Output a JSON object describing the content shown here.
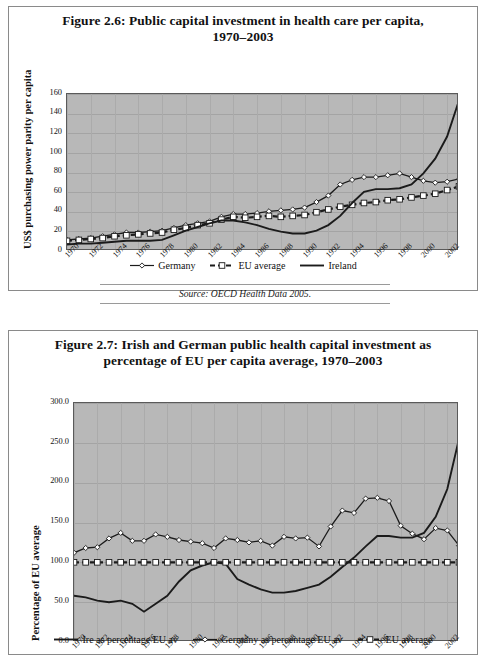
{
  "figures": [
    {
      "id": "fig-2-6",
      "title_line1": "Figure 2.6: Public capital investment in health care per capita,",
      "title_line2": "1970–2003",
      "source": "Source: OECD Health Data 2005.",
      "chart_data": {
        "type": "line",
        "title": "Figure 2.6: Public capital investment in health care per capita, 1970–2003",
        "xlabel": "",
        "ylabel": "US$ purchasing power parity per capita",
        "ylim": [
          0,
          170
        ],
        "yticks": [
          "0",
          "20",
          "40",
          "60",
          "80",
          "100",
          "120",
          "140",
          "160"
        ],
        "grid": true,
        "legend_position": "bottom",
        "x": [
          1970,
          1971,
          1972,
          1973,
          1974,
          1975,
          1976,
          1977,
          1978,
          1979,
          1980,
          1981,
          1982,
          1983,
          1984,
          1985,
          1986,
          1987,
          1988,
          1989,
          1990,
          1991,
          1992,
          1993,
          1994,
          1995,
          1996,
          1997,
          1998,
          1999,
          2000,
          2001,
          2002,
          2003
        ],
        "xticklabels": [
          "1970",
          "1972",
          "1974",
          "1976",
          "1978",
          "1980",
          "1982",
          "1984",
          "1986",
          "1988",
          "1990",
          "1992",
          "1994",
          "1996",
          "1998",
          "2000",
          "2002"
        ],
        "series": [
          {
            "name": "Germany",
            "marker": "diamond",
            "values": [
              12,
              13,
              14,
              16,
              18,
              20,
              20,
              21,
              22,
              25,
              28,
              30,
              32,
              37,
              40,
              40,
              41,
              43,
              44,
              45,
              47,
              53,
              60,
              72,
              77,
              80,
              80,
              82,
              84,
              80,
              76,
              74,
              75,
              78
            ]
          },
          {
            "name": "EU average",
            "marker": "square",
            "values": [
              11,
              12,
              13,
              14,
              16,
              17,
              18,
              19,
              20,
              23,
              25,
              28,
              30,
              34,
              37,
              36,
              37,
              38,
              37,
              38,
              39,
              42,
              45,
              48,
              50,
              52,
              53,
              55,
              56,
              58,
              60,
              62,
              66,
              70
            ]
          },
          {
            "name": "Ireland",
            "marker": "none",
            "values": [
              7,
              8,
              8,
              9,
              10,
              11,
              11,
              11,
              12,
              17,
              22,
              26,
              30,
              33,
              33,
              31,
              28,
              24,
              21,
              19,
              19,
              22,
              28,
              38,
              52,
              64,
              67,
              67,
              68,
              72,
              84,
              100,
              124,
              163
            ]
          }
        ]
      },
      "legend": [
        {
          "label": "Germany",
          "marker": "diamond-line"
        },
        {
          "label": "EU average",
          "marker": "square-dashed"
        },
        {
          "label": "Ireland",
          "marker": "solid-line"
        }
      ]
    },
    {
      "id": "fig-2-7",
      "title_line1": "Figure 2.7: Irish and German public health capital investment as",
      "title_line2": "percentage of EU per capita average, 1970–2003",
      "source": "",
      "chart_data": {
        "type": "line",
        "title": "Figure 2.7: Irish and German public health capital investment as percentage of EU per capita average, 1970–2003",
        "xlabel": "",
        "ylabel": "Percentage of EU average",
        "ylim": [
          0,
          300
        ],
        "yticks": [
          "0.0",
          "50.0",
          "100.0",
          "150.0",
          "200.0",
          "250.0",
          "300.0"
        ],
        "grid": true,
        "legend_position": "bottom",
        "x": [
          1970,
          1971,
          1972,
          1973,
          1974,
          1975,
          1976,
          1977,
          1978,
          1979,
          1980,
          1981,
          1982,
          1983,
          1984,
          1985,
          1986,
          1987,
          1988,
          1989,
          1990,
          1991,
          1992,
          1993,
          1994,
          1995,
          1996,
          1997,
          1998,
          1999,
          2000,
          2001,
          2002,
          2003
        ],
        "xticklabels": [
          "1970",
          "1972",
          "1974",
          "1976",
          "1978",
          "1980",
          "1982",
          "1984",
          "1986",
          "1988",
          "1990",
          "1992",
          "1994",
          "1996",
          "1998",
          "2000",
          "2002"
        ],
        "series": [
          {
            "name": "Ire as percentage EU av",
            "marker": "none",
            "values": [
              58,
              56,
              52,
              50,
              52,
              48,
              38,
              48,
              58,
              76,
              90,
              96,
              100,
              98,
              79,
              72,
              66,
              62,
              62,
              64,
              68,
              72,
              82,
              94,
              106,
              120,
              133,
              133,
              131,
              131,
              137,
              157,
              192,
              255
            ]
          },
          {
            "name": "Germany as percentage EU av",
            "marker": "diamond",
            "values": [
              112,
              118,
              119,
              130,
              137,
              127,
              127,
              135,
              132,
              128,
              126,
              124,
              118,
              130,
              128,
              125,
              127,
              121,
              132,
              130,
              131,
              120,
              145,
              165,
              162,
              180,
              181,
              177,
              146,
              136,
              129,
              143,
              140,
              121
            ]
          },
          {
            "name": "EU average",
            "marker": "square",
            "values": [
              100,
              100,
              100,
              100,
              100,
              100,
              100,
              100,
              100,
              100,
              100,
              100,
              100,
              100,
              100,
              100,
              100,
              100,
              100,
              100,
              100,
              100,
              100,
              100,
              100,
              100,
              100,
              100,
              100,
              100,
              100,
              100,
              100,
              100
            ]
          }
        ]
      },
      "legend": [
        {
          "label": "Ire as percentage EU av",
          "marker": "solid-line"
        },
        {
          "label": "Germany as percentage EU av",
          "marker": "diamond-line"
        },
        {
          "label": "EU average",
          "marker": "square-dashed"
        }
      ]
    }
  ]
}
